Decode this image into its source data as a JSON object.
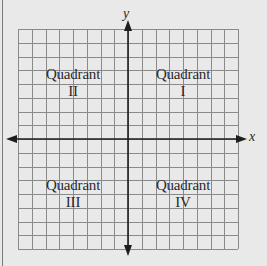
{
  "diagram": {
    "type": "coordinate-plane",
    "grid": {
      "columns": 16,
      "rows": 16,
      "cells_per_quadrant_side": 8
    },
    "axes": {
      "x_label": "x",
      "y_label": "y"
    },
    "quadrants": [
      {
        "id": "I",
        "word": "Quadrant",
        "numeral": "I",
        "position": "top-right"
      },
      {
        "id": "II",
        "word": "Quadrant",
        "numeral": "II",
        "position": "top-left"
      },
      {
        "id": "III",
        "word": "Quadrant",
        "numeral": "III",
        "position": "bottom-left"
      },
      {
        "id": "IV",
        "word": "Quadrant",
        "numeral": "IV",
        "position": "bottom-right"
      }
    ],
    "colors": {
      "background": "#e9e9e9",
      "grid_line": "#8a8a8a",
      "axis": "#1e1e1e",
      "text": "#2a2a2a"
    }
  }
}
